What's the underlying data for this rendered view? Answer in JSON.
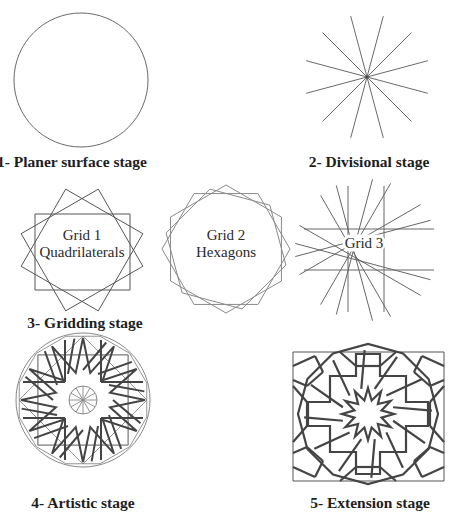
{
  "figure": {
    "stages": [
      {
        "id": 1,
        "caption": "1- Planer surface stage"
      },
      {
        "id": 2,
        "caption": "2- Divisional stage"
      },
      {
        "id": 3,
        "caption": "3- Gridding stage",
        "grids": [
          {
            "line1": "Grid 1",
            "line2": "Quadrilaterals"
          },
          {
            "line1": "Grid 2",
            "line2": "Hexagons"
          },
          {
            "line1": "Grid 3",
            "line2": ""
          }
        ]
      },
      {
        "id": 4,
        "caption": "4- Artistic stage"
      },
      {
        "id": 5,
        "caption": "5- Extension stage"
      }
    ],
    "colors": {
      "line": "#555555",
      "thick_line": "#444444",
      "background": "#ffffff"
    }
  }
}
